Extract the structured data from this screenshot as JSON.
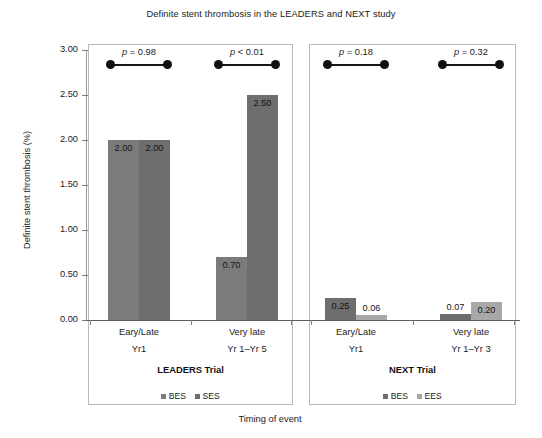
{
  "chart_data": {
    "type": "bar",
    "title": "Definite stent thrombosis in the LEADERS and NEXT study",
    "xlabel": "Timing of event",
    "ylabel": "Definite stent thrombosis (%)",
    "ylim": [
      0,
      3.0
    ],
    "ytick_labels": [
      "0.00",
      "0.50",
      "1.00",
      "1.50",
      "2.00",
      "2.50",
      "3.00"
    ],
    "ytick_values": [
      0.0,
      0.5,
      1.0,
      1.5,
      2.0,
      2.5,
      3.0
    ],
    "grid": false,
    "legend_position": "bottom-inside-panel",
    "colors": {
      "bes_leaders": "#7b7b7b",
      "ses_leaders": "#6e6e6e",
      "bes_next": "#6e6e6e",
      "ees_next": "#a8a8a8",
      "axis": "#9a9a9a",
      "panel_border": "#b9b9b9",
      "text": "#1a1a1a"
    },
    "panels": [
      {
        "id": "leaders",
        "trial_label": "LEADERS Trial",
        "legend": [
          {
            "label": "BES",
            "color": "#7b7b7b"
          },
          {
            "label": "SES",
            "color": "#6e6e6e"
          }
        ],
        "groups": [
          {
            "category": "Eary/Late",
            "subcategory": "Yr1",
            "p_prefix": "p",
            "p_operator": "=",
            "p_value": "0.98",
            "bars": [
              {
                "series": "BES",
                "value": 2.0,
                "label": "2.00",
                "color": "#7b7b7b"
              },
              {
                "series": "SES",
                "value": 2.0,
                "label": "2.00",
                "color": "#6e6e6e"
              }
            ]
          },
          {
            "category": "Very late",
            "subcategory": "Yr 1–Yr 5",
            "p_prefix": "p",
            "p_operator": "<",
            "p_value": "0.01",
            "bars": [
              {
                "series": "BES",
                "value": 0.7,
                "label": "0.70",
                "color": "#7b7b7b"
              },
              {
                "series": "SES",
                "value": 2.5,
                "label": "2.50",
                "color": "#6e6e6e"
              }
            ]
          }
        ]
      },
      {
        "id": "next",
        "trial_label": "NEXT Trial",
        "legend": [
          {
            "label": "BES",
            "color": "#6e6e6e"
          },
          {
            "label": "EES",
            "color": "#a8a8a8"
          }
        ],
        "groups": [
          {
            "category": "Eary/Late",
            "subcategory": "Yr1",
            "p_prefix": "p",
            "p_operator": "=",
            "p_value": "0.18",
            "bars": [
              {
                "series": "BES",
                "value": 0.25,
                "label": "0.25",
                "color": "#6e6e6e"
              },
              {
                "series": "EES",
                "value": 0.06,
                "label": "0.06",
                "color": "#a8a8a8"
              }
            ]
          },
          {
            "category": "Very late",
            "subcategory": "Yr 1–Yr 3",
            "p_prefix": "p",
            "p_operator": "=",
            "p_value": "0.32",
            "bars": [
              {
                "series": "BES",
                "value": 0.07,
                "label": "0.07",
                "color": "#6e6e6e"
              },
              {
                "series": "EES",
                "value": 0.2,
                "label": "0.20",
                "color": "#a8a8a8"
              }
            ]
          }
        ]
      }
    ]
  }
}
